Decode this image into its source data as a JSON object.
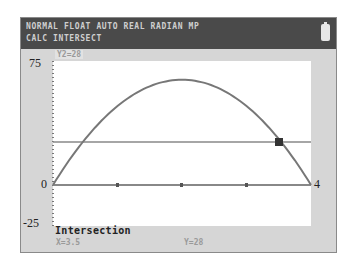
{
  "status_bar": {
    "line1": "NORMAL FLOAT AUTO REAL RADIAN MP",
    "line2": "CALC INTERSECT",
    "battery_icon": "battery-icon"
  },
  "graph": {
    "function_label": "Y2=28",
    "y_max_label": "75",
    "y_zero_label": "0",
    "y_min_label": "-25",
    "x_max_label": "4",
    "window": {
      "xmin": 0,
      "xmax": 4,
      "ymin": -25,
      "ymax": 75
    }
  },
  "result": {
    "title": "Intersection",
    "x_value": "X=3.5",
    "y_value": "Y=28"
  },
  "chart_data": {
    "type": "line",
    "title": "",
    "xlabel": "",
    "ylabel": "",
    "xlim": [
      0,
      4
    ],
    "ylim": [
      -25,
      75
    ],
    "series": [
      {
        "name": "Y1",
        "equation": "64x-16x^2",
        "x": [
          0,
          0.5,
          1,
          1.5,
          2,
          2.5,
          3,
          3.5,
          4
        ],
        "values": [
          0,
          28,
          48,
          60,
          64,
          60,
          48,
          28,
          0
        ]
      },
      {
        "name": "Y2",
        "equation": "28",
        "x": [
          0,
          4
        ],
        "values": [
          28,
          28
        ]
      }
    ],
    "annotations": [
      {
        "label": "Intersection",
        "x": 3.5,
        "y": 28
      }
    ],
    "tick_labels": {
      "y": [
        "75",
        "0",
        "-25"
      ],
      "x": [
        "4"
      ]
    },
    "grid": false
  }
}
